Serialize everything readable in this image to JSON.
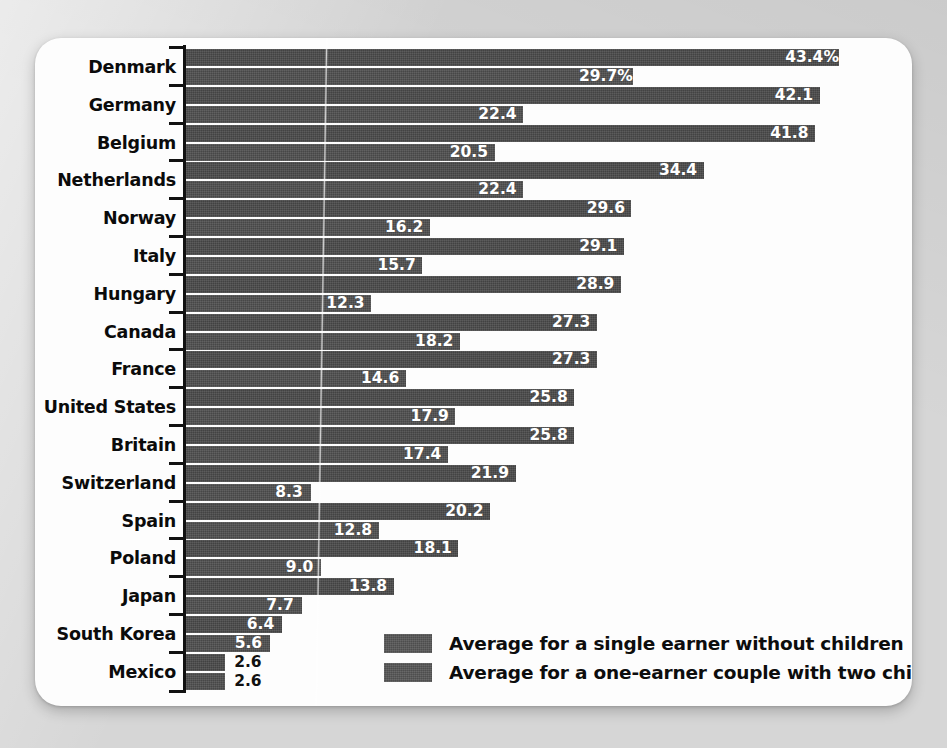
{
  "chart_data": {
    "type": "bar",
    "orientation": "horizontal",
    "title": "",
    "xlabel": "",
    "ylabel": "",
    "grid": false,
    "xlim": [
      0,
      43.4
    ],
    "unit": "%",
    "legend_position": "inside-bottom-right",
    "categories": [
      "Denmark",
      "Germany",
      "Belgium",
      "Netherlands",
      "Norway",
      "Italy",
      "Hungary",
      "Canada",
      "France",
      "United States",
      "Britain",
      "Switzerland",
      "Spain",
      "Poland",
      "Japan",
      "South Korea",
      "Mexico"
    ],
    "series": [
      {
        "name": "Average for a single earner without children",
        "values": [
          43.4,
          42.1,
          41.8,
          34.4,
          29.6,
          29.1,
          28.9,
          27.3,
          27.3,
          25.8,
          25.8,
          21.9,
          20.2,
          18.1,
          13.8,
          6.4,
          2.6
        ],
        "labels": [
          "43.4%",
          "42.1",
          "41.8",
          "34.4",
          "29.6",
          "29.1",
          "28.9",
          "27.3",
          "27.3",
          "25.8",
          "25.8",
          "21.9",
          "20.2",
          "18.1",
          "13.8",
          "6.4",
          "2.6"
        ],
        "color": "#4a4a4a"
      },
      {
        "name": "Average for a one-earner couple with two children",
        "values": [
          29.7,
          22.4,
          20.5,
          22.4,
          16.2,
          15.7,
          12.3,
          18.2,
          14.6,
          17.9,
          17.4,
          8.3,
          12.8,
          9.0,
          7.7,
          5.6,
          2.6
        ],
        "labels": [
          "29.7%",
          "22.4",
          "20.5",
          "22.4",
          "16.2",
          "15.7",
          "12.3",
          "18.2",
          "14.6",
          "17.9",
          "17.4",
          "8.3",
          "12.8",
          "9.0",
          "7.7",
          "5.6",
          "2.6"
        ],
        "color": "#4f4f4f"
      }
    ]
  },
  "legend": {
    "items": [
      {
        "label": "Average for a single earner without children",
        "color": "#565656"
      },
      {
        "label": "Average for a one-earner couple with two children",
        "color": "#565656"
      }
    ]
  },
  "style": {
    "page_background": "#d6d6d6",
    "card_background": "#fdfdfd",
    "axis_color": "#111111",
    "label_color": "#0b0b0b",
    "value_inside_color": "#ffffff",
    "value_outside_color": "#111111"
  }
}
